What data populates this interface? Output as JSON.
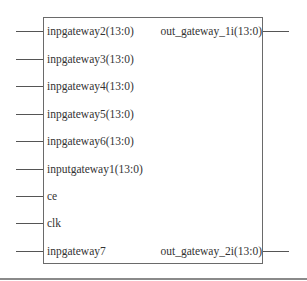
{
  "block": {
    "inputs": [
      {
        "label": "inpgateway2(13:0)",
        "y": 31
      },
      {
        "label": "inpgateway3(13:0)",
        "y": 59
      },
      {
        "label": "inpgateway4(13:0)",
        "y": 86
      },
      {
        "label": "inpgateway5(13:0)",
        "y": 114
      },
      {
        "label": "inpgateway6(13:0)",
        "y": 141
      },
      {
        "label": "inputgateway1(13:0)",
        "y": 169
      },
      {
        "label": "ce",
        "y": 196
      },
      {
        "label": "clk",
        "y": 223
      },
      {
        "label": "inpgateway7",
        "y": 251
      }
    ],
    "outputs": [
      {
        "label": "out_gateway_1i(13:0)",
        "y": 31
      },
      {
        "label": "out_gateway_2i(13:0)",
        "y": 251
      }
    ]
  },
  "colors": {
    "border": "#6a6a6a",
    "wire": "#555555",
    "text": "#333333"
  }
}
